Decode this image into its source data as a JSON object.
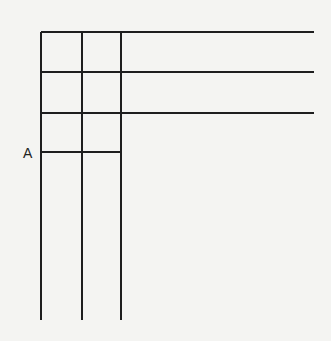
{
  "diagram": {
    "type": "line-grid",
    "stroke_color": "#1e1e1e",
    "background_color": "#f4f4f2",
    "labels": [
      {
        "id": "A",
        "text": "A",
        "x": 23,
        "y": 146
      }
    ],
    "vertical_lines": [
      {
        "x": 41,
        "y1": 32,
        "y2": 320
      },
      {
        "x": 82,
        "y1": 32,
        "y2": 320
      },
      {
        "x": 121,
        "y1": 32,
        "y2": 320
      }
    ],
    "horizontal_lines": [
      {
        "y": 32,
        "x1": 41,
        "x2": 314
      },
      {
        "y": 72,
        "x1": 41,
        "x2": 314
      },
      {
        "y": 113,
        "x1": 41,
        "x2": 314
      },
      {
        "y": 152,
        "x1": 41,
        "x2": 121,
        "labeled": "A"
      }
    ]
  }
}
